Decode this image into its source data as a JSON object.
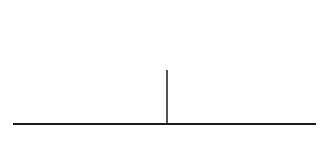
{
  "diagram": {
    "curves": [
      {
        "id": "T1",
        "label": "T",
        "subscript": "1",
        "peak_x": 140,
        "sigma": 23
      },
      {
        "id": "T2",
        "label": "T",
        "subscript": "2",
        "peak_x": 209,
        "sigma": 23
      }
    ],
    "cutoff": {
      "label": "C",
      "x": 167
    },
    "colors": {
      "stroke": "#1a1a1a",
      "background": "#ffffff"
    }
  }
}
